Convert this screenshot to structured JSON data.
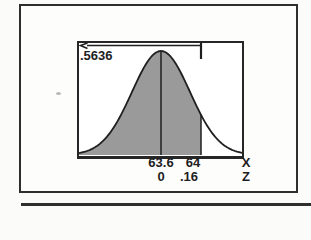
{
  "figure": {
    "probability_label": ".5636",
    "x_axis": {
      "tick_mean": "63.6",
      "tick_boundary": "64",
      "label": "X"
    },
    "z_axis": {
      "tick_mean": "0",
      "tick_boundary": ".16",
      "label": "Z"
    }
  },
  "chart_data": {
    "type": "area",
    "title": "",
    "mean_x": 63.6,
    "boundary_x": 64,
    "mean_z": 0,
    "boundary_z": 0.16,
    "shaded_probability": 0.5636,
    "x_ticks": [
      "63.6",
      "64"
    ],
    "z_ticks": [
      "0",
      ".16"
    ],
    "x_axis_label": "X",
    "z_axis_label": "Z",
    "shaded_region": "left tail up to Z = .16",
    "legend": "none",
    "grid": false
  },
  "colors": {
    "shade": "#9a9a9a",
    "line": "#1f1f1f",
    "border": "#2e2e2e",
    "background": "#fbfbf9"
  }
}
